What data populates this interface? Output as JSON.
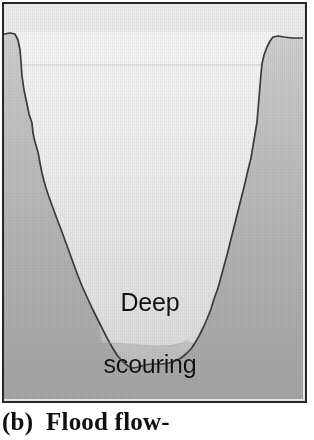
{
  "figure": {
    "kind": "river-channel-cross-section-diagram",
    "caption": "(b)  Flood flow-",
    "caption_label": "(b)",
    "caption_text": "Flood flow-",
    "frame": {
      "border_color": "#272727",
      "border_width_px": 2,
      "x": 2,
      "y": 2,
      "width": 305,
      "height": 401
    },
    "annotation": {
      "line1": "Deep",
      "line2": "scouring",
      "text": "Deep scouring",
      "color": "#111111",
      "center_x": 146,
      "center_y": 285
    },
    "colors": {
      "bank_light": "#c6c6c6",
      "bank_dark": "#a6a6a6",
      "channel_light": "#f1f1f1",
      "channel_dark": "#dcdcdc",
      "sediment": "#c0c0c0",
      "outline": "#3a3a3a",
      "waterline": "#cfcfcf",
      "frame": "#272727",
      "page": "#ffffff"
    },
    "waterline": {
      "label": "water-surface-line",
      "y": 63,
      "x_start": 18,
      "x_end": 272
    },
    "banks": {
      "left_crest_x": 13,
      "left_crest_y": 32,
      "right_crest_x": 276,
      "right_crest_y": 34,
      "channel_bottom_x": 130,
      "channel_bottom_y": 366
    },
    "sediment_band": {
      "label": "deep-scour-sediment-fill",
      "top_y": 340,
      "bottom_y": 368
    },
    "paths": {
      "left_bank_outline": "M 2 32 L 8 31 L 13 32 L 16 38 L 18 48 L 19 60 L 20 74 L 22 88 L 25 102 L 27 112 L 30 121 L 31 131 L 33 140 L 36 150 L 38 161 L 40 171 L 42 179 L 44 186 L 47 195 L 51 206 L 55 217 L 60 230 L 64 241 L 68 252 L 72 263 L 76 274 L 80 284 L 85 295 L 90 306 L 95 316 L 100 326 L 105 336 L 110 345 L 115 353 L 120 359 L 126 364 L 131 366 L 137 365 L 143 363 L 149 362 L 155 362 L 161 362 L 167 361 L 173 359 L 179 356 L 184 352 L 189 347 L 193 341 L 197 334 L 201 326 L 205 317 L 209 307 L 212 297 L 216 286 L 219 275 L 222 264 L 225 253 L 228 241 L 231 229 L 234 217 L 237 205 L 240 193 L 243 181 L 246 168 L 249 156 L 251 144 L 253 132 L 255 120 L 256 108 L 257 96 L 258 84 L 259 72 L 260 62 L 262 53 L 265 45 L 268 39 L 271 35 L 276 34 L 282 35 L 290 36 L 298 36 L 303 36",
      "sediment_top": "M 100 341 L 112 341 L 125 342 L 140 343 L 155 344 L 168 344 L 178 342 L 186 338"
    }
  }
}
